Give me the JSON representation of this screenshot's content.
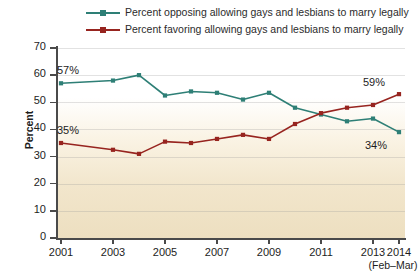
{
  "chart_data": {
    "type": "line",
    "title": "",
    "xlabel": "",
    "ylabel": "Percent",
    "ylim": [
      0,
      70
    ],
    "ytick_values": [
      0,
      10,
      20,
      30,
      40,
      50,
      60,
      70
    ],
    "xtick_labels": [
      "2001",
      "2003",
      "2005",
      "2007",
      "2009",
      "2011",
      "2013",
      "2014"
    ],
    "xtick_sublabel": "(Feb–Mar)",
    "grid": true,
    "legend_position": "top",
    "series": [
      {
        "name": "Percent opposing allowing gays and lesbians to marry legally",
        "color": "#2e7f76",
        "points": [
          {
            "year": 2001,
            "value": 57
          },
          {
            "year": 2003,
            "value": 58
          },
          {
            "year": 2004,
            "value": 60
          },
          {
            "year": 2005,
            "value": 52.5
          },
          {
            "year": 2006,
            "value": 54
          },
          {
            "year": 2007,
            "value": 53.5
          },
          {
            "year": 2008,
            "value": 51
          },
          {
            "year": 2009,
            "value": 53.5
          },
          {
            "year": 2010,
            "value": 48
          },
          {
            "year": 2011,
            "value": 45.5
          },
          {
            "year": 2012,
            "value": 43
          },
          {
            "year": 2013,
            "value": 44
          },
          {
            "year": 2014,
            "value": 39
          }
        ]
      },
      {
        "name": "Percent favoring allowing gays and lesbians to marry legally",
        "color": "#97241f",
        "points": [
          {
            "year": 2001,
            "value": 35
          },
          {
            "year": 2003,
            "value": 32.5
          },
          {
            "year": 2004,
            "value": 31
          },
          {
            "year": 2005,
            "value": 35.5
          },
          {
            "year": 2006,
            "value": 35
          },
          {
            "year": 2007,
            "value": 36.5
          },
          {
            "year": 2008,
            "value": 38
          },
          {
            "year": 2009,
            "value": 36.5
          },
          {
            "year": 2010,
            "value": 42
          },
          {
            "year": 2011,
            "value": 46
          },
          {
            "year": 2012,
            "value": 48
          },
          {
            "year": 2013,
            "value": 49
          },
          {
            "year": 2014,
            "value": 53
          }
        ]
      }
    ],
    "annotations": [
      {
        "text": "57%",
        "series": "opposing",
        "year": 2001,
        "position": "above-right"
      },
      {
        "text": "35%",
        "series": "favoring",
        "year": 2001,
        "position": "above-right"
      },
      {
        "text": "59%",
        "series": "favoring",
        "year": 2014,
        "position": "above-left"
      },
      {
        "text": "34%",
        "series": "opposing",
        "year": 2014,
        "position": "below-left"
      }
    ]
  },
  "legend": {
    "items": [
      {
        "label": "Percent opposing allowing gays and lesbians to marry legally",
        "color": "#2e7f76"
      },
      {
        "label": "Percent favoring allowing gays and lesbians to marry legally",
        "color": "#97241f"
      }
    ]
  },
  "axes": {
    "y_title": "Percent",
    "y_labels": [
      "70",
      "60",
      "50",
      "40",
      "30",
      "20",
      "10",
      "0"
    ],
    "x_labels": [
      "2001",
      "2003",
      "2005",
      "2007",
      "2009",
      "2011",
      "2013",
      "2014"
    ],
    "x_sublabel": "(Feb–Mar)"
  },
  "annotations": {
    "opposing_start": "57%",
    "favoring_start": "35%",
    "favoring_end": "59%",
    "opposing_end": "34%"
  }
}
